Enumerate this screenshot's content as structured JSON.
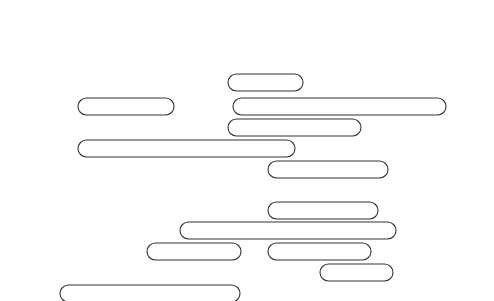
{
  "puzzle": {
    "title": "",
    "grid": [
      {
        "row": 0,
        "y": 82,
        "start_col": 8,
        "letters": "SAPS",
        "note": "top fragment: S A P S"
      },
      {
        "row": 1,
        "y": 105,
        "letters": "T",
        "col": 8.5
      },
      {
        "row": 2,
        "y": 125,
        "letters": "R",
        "col": 8
      },
      {
        "row": 1,
        "y": 105,
        "letters": "R",
        "col": 12.5
      },
      {
        "row": 2,
        "y": 125,
        "letters": "I",
        "col": 13
      }
    ],
    "rows": [
      "W J E T L A G O E A F R E Q U E N T F L Y E R N",
      "H S G O V E S H R A E R U T R A P E D D S T S O",
      "S T R A V E L E R S C H E C K S O O V M O U I Y",
      "U E E S R E M C E H R D S M O T S U C U A I G R",
      "N R K I H L A R R A T T U E L Y T T C R Y O H H R",
      "A B C C O C T V B H R I T U N P A C K H T A S T A",
      "R H I N P H A O M O N E Y E X C H A N G E U L S C",
      "O T T O P T L A P T O P F L A V I R R A G C I E H",
      "O T C I I W S A E S K R O N V B D N A B V K E D",
      "O M O N A S C A L E R E H E R E W U O Y H S I W",
      "T N E G A L E V A R T E D R A C E N O H P T N N",
      "S I O P L U G G A G E T A G A B T N E M R A G N"
    ],
    "found_words": [
      "JETLAG",
      "FREQUENTFLYER",
      "DEPARTURE",
      "TRAVELERSCHECKS",
      "SMOTSUC",
      "UNPACK",
      "MONEYEXCHANGE",
      "LAVIRRA",
      "LAPTOP",
      "BDNAB",
      "EREHEREWUOYHSIW",
      "TRAVELAGENT",
      "DRACENOHP",
      "LUGGAGETAG",
      "SIGHTSEEING",
      "NORTH",
      "SHOPPING",
      "TICKET",
      "SAPS",
      "PASSPORT",
      "SPIRIT",
      "DUTYFREE",
      "ARRIVAL",
      "NOWRESERVATION"
    ]
  }
}
